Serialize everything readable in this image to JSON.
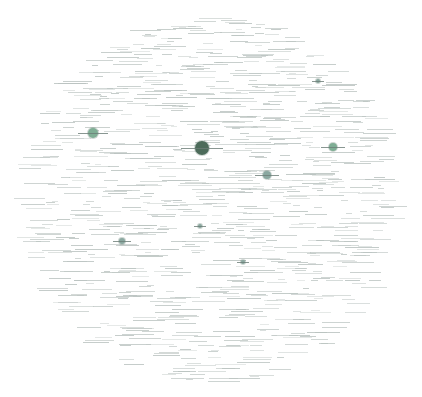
{
  "graph": {
    "type": "force-directed network",
    "background": "#ffffff",
    "node_color": "#6f9a88",
    "hub_color": "#3f5f4f",
    "label_color": "#b9c2bf",
    "hubs": [
      {
        "id": "hub-center",
        "x": 202,
        "y": 148,
        "r": 7,
        "color": "#4c6b5a",
        "label": ""
      },
      {
        "id": "hub-left",
        "x": 93,
        "y": 133,
        "r": 5,
        "color": "#7fae95",
        "label": ""
      },
      {
        "id": "hub-right",
        "x": 333,
        "y": 147,
        "r": 4,
        "color": "#7fae95",
        "label": ""
      },
      {
        "id": "hub-mid-right",
        "x": 267,
        "y": 175,
        "r": 4,
        "color": "#8aa8a0",
        "label": ""
      },
      {
        "id": "hub-lower-left",
        "x": 122,
        "y": 241,
        "r": 3,
        "color": "#8aa8a0",
        "label": ""
      },
      {
        "id": "hub-upper-right",
        "x": 318,
        "y": 81,
        "r": 2,
        "color": "#8aa8a0",
        "label": ""
      },
      {
        "id": "hub-lower-mid",
        "x": 243,
        "y": 262,
        "r": 2,
        "color": "#8aa8a0",
        "label": ""
      },
      {
        "id": "hub-lower-center",
        "x": 200,
        "y": 226,
        "r": 2,
        "color": "#8aa8a0",
        "label": ""
      }
    ]
  }
}
